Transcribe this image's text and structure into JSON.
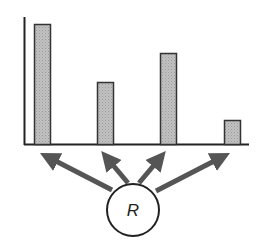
{
  "chart_data": {
    "type": "bar",
    "title": "",
    "xlabel": "",
    "ylabel": "",
    "categories": [
      "1",
      "2",
      "3",
      "4"
    ],
    "values": [
      120,
      62,
      91,
      24
    ],
    "grid": false,
    "bar_color": "#b4b4b4",
    "bar_border_color": "#333333"
  },
  "diagram": {
    "node_label": "R",
    "arrow_color": "#555555",
    "arrow_count": 4
  }
}
